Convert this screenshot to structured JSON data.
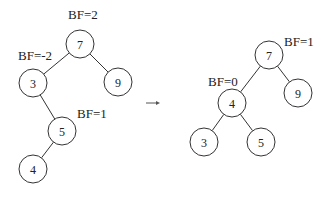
{
  "diagram": {
    "type": "avl-rotation",
    "before": {
      "nodes": [
        {
          "id": "b7",
          "value": "7",
          "bf_label": "BF=2"
        },
        {
          "id": "b3",
          "value": "3",
          "bf_label": "BF=-2"
        },
        {
          "id": "b9",
          "value": "9",
          "bf_label": null
        },
        {
          "id": "b5",
          "value": "5",
          "bf_label": "BF=1"
        },
        {
          "id": "b4",
          "value": "4",
          "bf_label": null
        }
      ],
      "edges": [
        [
          "b7",
          "b3"
        ],
        [
          "b7",
          "b9"
        ],
        [
          "b3",
          "b5"
        ],
        [
          "b5",
          "b4"
        ]
      ]
    },
    "arrow": "→",
    "after": {
      "nodes": [
        {
          "id": "a7",
          "value": "7",
          "bf_label": "BF=1"
        },
        {
          "id": "a4",
          "value": "4",
          "bf_label": "BF=0"
        },
        {
          "id": "a9",
          "value": "9",
          "bf_label": null
        },
        {
          "id": "a3",
          "value": "3",
          "bf_label": null
        },
        {
          "id": "a5",
          "value": "5",
          "bf_label": null
        }
      ],
      "edges": [
        [
          "a7",
          "a4"
        ],
        [
          "a7",
          "a9"
        ],
        [
          "a4",
          "a3"
        ],
        [
          "a4",
          "a5"
        ]
      ]
    }
  }
}
